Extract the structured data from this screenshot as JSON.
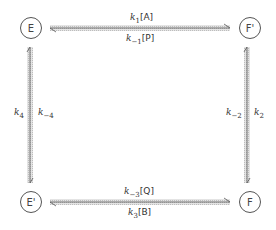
{
  "nodes": {
    "E": "E",
    "F_prime": "F'",
    "E_prime": "E'",
    "F": "F"
  },
  "edges": {
    "top_forward": {
      "k": "k",
      "sub": "1",
      "species": "[A]"
    },
    "top_reverse": {
      "k": "k",
      "sub": "−1",
      "species": "[P]"
    },
    "right_forward": {
      "k": "k",
      "sub": "2"
    },
    "right_reverse": {
      "k": "k",
      "sub": "−2"
    },
    "bottom_forward": {
      "k": "k",
      "sub": "3",
      "species": "[B]"
    },
    "bottom_reverse": {
      "k": "k",
      "sub": "−3",
      "species": "[Q]"
    },
    "left_forward": {
      "k": "k",
      "sub": "4"
    },
    "left_reverse": {
      "k": "k",
      "sub": "−4"
    }
  },
  "colors": {
    "arrow_fill": "#d9d9d9",
    "arrow_line": "#555555"
  }
}
